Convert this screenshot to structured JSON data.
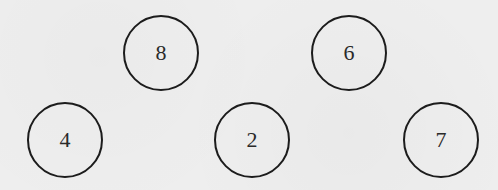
{
  "diagram": {
    "type": "number-circles",
    "nodes": [
      {
        "label": "8",
        "cx": 161,
        "cy": 53,
        "r": 38
      },
      {
        "label": "6",
        "cx": 349,
        "cy": 53,
        "r": 38
      },
      {
        "label": "4",
        "cx": 65,
        "cy": 140,
        "r": 38
      },
      {
        "label": "2",
        "cx": 252,
        "cy": 140,
        "r": 38
      },
      {
        "label": "7",
        "cx": 441,
        "cy": 140,
        "r": 38
      }
    ],
    "colors": {
      "background": "#eeeeee",
      "stroke": "#1c1c1c",
      "text": "#2a2a2a"
    }
  }
}
